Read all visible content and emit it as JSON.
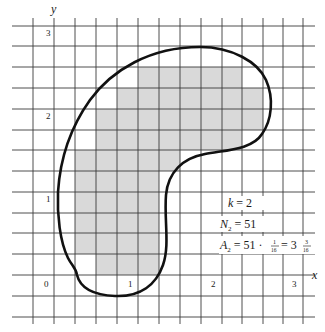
{
  "figure": {
    "axes": {
      "x_label": "x",
      "y_label": "y",
      "x_ticks": [
        {
          "label": "0",
          "value": 0
        },
        {
          "label": "1",
          "value": 1
        },
        {
          "label": "2",
          "value": 2
        },
        {
          "label": "3",
          "value": 3
        }
      ],
      "y_ticks": [
        {
          "label": "0",
          "value": 0
        },
        {
          "label": "1",
          "value": 1
        },
        {
          "label": "2",
          "value": 2
        },
        {
          "label": "3",
          "value": 3
        }
      ],
      "grid_subdivisions_per_unit": 4
    },
    "annotations": {
      "k_line": "k = 2",
      "n_line_symbol": "N",
      "n_line_subscript": "2",
      "n_line_value": "= 51",
      "a_line_symbol": "A",
      "a_line_subscript": "2",
      "a_line_prefix": "= 51 ·",
      "a_frac1_num": "1",
      "a_frac1_den": "16",
      "a_line_mid": "= 3",
      "a_frac2_num": "3",
      "a_frac2_den": "16"
    },
    "shaded_rows": [
      {
        "row_from_top": 0,
        "start_col": 4,
        "count": 5
      },
      {
        "row_from_top": 1,
        "start_col": 3,
        "count": 7
      },
      {
        "row_from_top": 2,
        "start_col": 2,
        "count": 8
      },
      {
        "row_from_top": 3,
        "start_col": 2,
        "count": 7
      },
      {
        "row_from_top": 4,
        "start_col": 1,
        "count": 5
      },
      {
        "row_from_top": 5,
        "start_col": 1,
        "count": 4
      },
      {
        "row_from_top": 6,
        "start_col": 1,
        "count": 4
      },
      {
        "row_from_top": 7,
        "start_col": 1,
        "count": 4
      },
      {
        "row_from_top": 8,
        "start_col": 1,
        "count": 4
      },
      {
        "row_from_top": 9,
        "start_col": 2,
        "count": 3
      }
    ],
    "shaded_cell_total": 51,
    "colors": {
      "grid": "#3a3a3a",
      "shade": "#d9d9d9",
      "curve": "#111111",
      "text": "#1a1a1a"
    }
  }
}
